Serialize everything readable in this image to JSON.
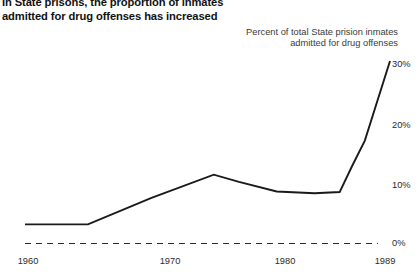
{
  "title": {
    "line1": "In State prisons, the proportion of inmates",
    "line2": "admitted for drug offenses has increased"
  },
  "annotation": {
    "line1": "Percent of total State prision inmates",
    "line2": "admitted for drug offenses"
  },
  "axes": {
    "y_ticks": [
      "30%",
      "20%",
      "10%",
      "0%"
    ],
    "x_ticks": [
      "1960",
      "1970",
      "1980",
      "1989"
    ]
  },
  "colors": {
    "line": "#1a1a1a",
    "baseline": "#2b2b2b",
    "text": "#1a1a1a",
    "background": "#ffffff"
  },
  "chart_data": {
    "type": "line",
    "title": "In State prisons, the proportion of inmates admitted for drug offenses has increased",
    "subtitle": "Percent of total State prision inmates admitted for drug offenses",
    "xlabel": "",
    "ylabel": "Percent of total State prision inmates admitted for drug offenses",
    "xlim": [
      1960,
      1989
    ],
    "ylim": [
      0,
      32
    ],
    "grid": false,
    "legend": null,
    "x_tick_values": [
      1960,
      1970,
      1980,
      1989
    ],
    "x_tick_labels": [
      "1960",
      "1970",
      "1980",
      "1989"
    ],
    "y_tick_values": [
      0,
      10,
      20,
      30
    ],
    "y_tick_labels": [
      "0%",
      "10%",
      "20%",
      "30%"
    ],
    "baseline_style": "dashed",
    "series": [
      {
        "name": "Percent of State prison admissions for drug offenses",
        "x": [
          1960,
          1963,
          1965,
          1970,
          1975,
          1977,
          1980,
          1983,
          1985,
          1986,
          1987,
          1989
        ],
        "values": [
          3.2,
          3.2,
          3.2,
          7.6,
          11.5,
          10.3,
          8.7,
          8.4,
          8.6,
          13.0,
          17.2,
          30.5
        ]
      }
    ]
  }
}
